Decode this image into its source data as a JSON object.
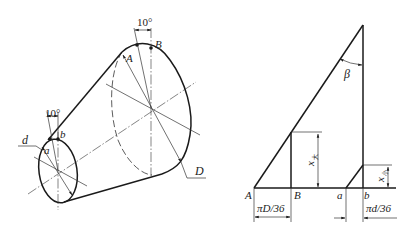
{
  "figure": {
    "left_view": {
      "name": "truncated-cone-isometric",
      "angle_small_end": "10°",
      "angle_large_end": "10°",
      "labels": {
        "small_diameter": "d",
        "point_a": "a",
        "point_b": "b",
        "large_diameter": "D",
        "point_A": "A",
        "point_B": "B"
      }
    },
    "right_view": {
      "name": "development-triangle",
      "labels": {
        "angle": "β",
        "point_A": "A",
        "point_B": "B",
        "point_a": "a",
        "point_b": "b",
        "height_large": "x",
        "height_large_sub": "大",
        "height_small": "x",
        "height_small_sub": "小",
        "dim_large": "πD/36",
        "dim_small": "πd/36"
      }
    }
  }
}
